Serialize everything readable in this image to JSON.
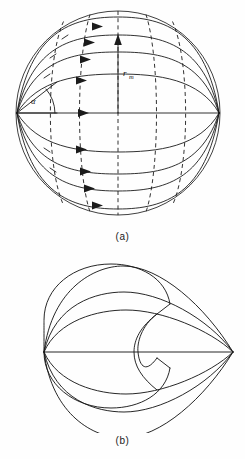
{
  "figure": {
    "background_color": "#fefefe",
    "ink_color": "#1b1b1b",
    "panels": [
      {
        "id": "a",
        "caption": "(a)",
        "description": "Sphere with converging latitude-like streamlines between two poles on the horizontal axis, dashed meridian arcs, flow arrows, angle alpha and radius r sub m",
        "labels": {
          "radius_symbol": "r",
          "radius_subscript": "m",
          "angle_symbol": "α"
        },
        "geometry": {
          "circle_center_x": 118,
          "circle_center_y": 113,
          "circle_radius": 102,
          "left_pole_x": 17,
          "left_pole_y": 113,
          "right_pole_x": 219,
          "right_pole_y": 113,
          "streamline_count": 9,
          "meridian_count": 5,
          "arrow_count": 9
        }
      },
      {
        "id": "b",
        "caption": "(b)",
        "description": "Teardrop / cardioid-like developed surface: left focal point with rays converging to a right-hand cusp, bounded by a part circle and an interior C-shaped arc",
        "geometry": {
          "left_point_x": 44,
          "left_point_y": 104,
          "right_cusp_x": 233,
          "right_cusp_y": 104,
          "ray_count": 7,
          "arc_count": 1
        }
      }
    ]
  },
  "captions": {
    "panel_a": "(a)",
    "panel_b": "(b)"
  }
}
